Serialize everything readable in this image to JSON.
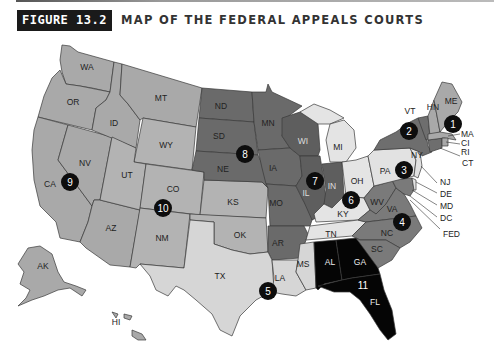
{
  "header": {
    "figure_label": "FIGURE 13.2",
    "title": "MAP OF THE FEDERAL APPEALS COURTS"
  },
  "colors": {
    "c1": "#a9a9a9",
    "c2": "#6e6e6e",
    "c3": "#e2e2e2",
    "c4": "#7a7a7a",
    "c5": "#d6d6d6",
    "c6": "#e6e6e6",
    "c7": "#5e5e5e",
    "c8": "#6a6a6a",
    "c9": "#c2c2c2",
    "c10": "#b3b3b3",
    "c11": "#000000",
    "outline": "#3a3a3a",
    "circle_fill": "#0d0d0d"
  },
  "states": {
    "WA": "WA",
    "OR": "OR",
    "CA": "CA",
    "NV": "NV",
    "ID": "ID",
    "MT": "MT",
    "AZ": "AZ",
    "AK": "AK",
    "HI": "HI",
    "WY": "WY",
    "UT": "UT",
    "CO": "CO",
    "NM": "NM",
    "KS": "KS",
    "OK": "OK",
    "ND": "ND",
    "SD": "SD",
    "NE": "NE",
    "MN": "MN",
    "IA": "IA",
    "MO": "MO",
    "AR": "AR",
    "WI": "WI",
    "IL": "IL",
    "IN": "IN",
    "MI": "MI",
    "OH": "OH",
    "KY": "KY",
    "TN": "TN",
    "TX": "TX",
    "LA": "LA",
    "MS": "MS",
    "AL": "AL",
    "GA": "GA",
    "FL": "FL",
    "WV": "WV",
    "VA": "VA",
    "NC": "NC",
    "SC": "SC",
    "PA": "PA",
    "NJ": "NJ",
    "DE": "DE",
    "NY": "NY",
    "VT": "VT",
    "CT": "CT",
    "ME": "ME",
    "NH": "HN",
    "MA": "MA",
    "RI": "RI",
    "PR": "CI",
    "MD": "MD",
    "DC": "DC",
    "FED": "FED"
  },
  "circuits": [
    {
      "number": "1",
      "states": [
        "ME",
        "NH",
        "MA",
        "RI",
        "PR"
      ]
    },
    {
      "number": "2",
      "states": [
        "NY",
        "VT",
        "CT"
      ]
    },
    {
      "number": "3",
      "states": [
        "PA",
        "NJ",
        "DE"
      ]
    },
    {
      "number": "4",
      "states": [
        "MD",
        "VA",
        "WV",
        "NC",
        "SC"
      ]
    },
    {
      "number": "5",
      "states": [
        "TX",
        "LA",
        "MS"
      ]
    },
    {
      "number": "6",
      "states": [
        "MI",
        "OH",
        "KY",
        "TN"
      ]
    },
    {
      "number": "7",
      "states": [
        "WI",
        "IL",
        "IN"
      ]
    },
    {
      "number": "8",
      "states": [
        "ND",
        "SD",
        "NE",
        "MN",
        "IA",
        "MO",
        "AR"
      ]
    },
    {
      "number": "9",
      "states": [
        "WA",
        "OR",
        "CA",
        "NV",
        "ID",
        "MT",
        "AZ",
        "AK",
        "HI"
      ]
    },
    {
      "number": "10",
      "states": [
        "WY",
        "UT",
        "CO",
        "NM",
        "KS",
        "OK"
      ]
    },
    {
      "number": "11",
      "states": [
        "AL",
        "GA",
        "FL"
      ]
    }
  ],
  "callouts": [
    "MA",
    "CI",
    "RI",
    "CT",
    "NJ",
    "DE",
    "MD",
    "DC",
    "FED"
  ]
}
